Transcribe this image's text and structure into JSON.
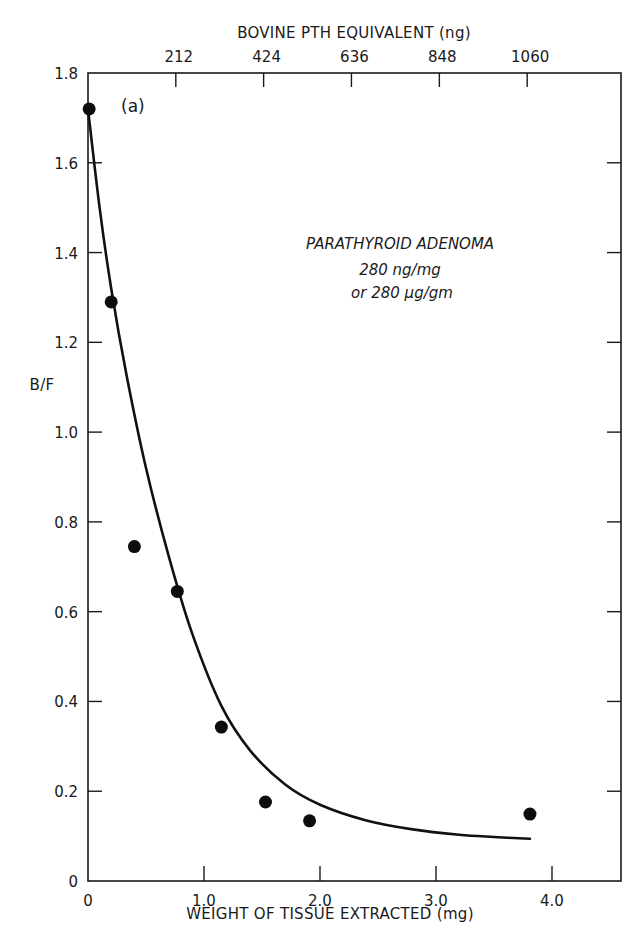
{
  "chart_data": {
    "type": "scatter",
    "title": "",
    "panel_label": "(a)",
    "xlabel": "WEIGHT OF TISSUE EXTRACTED (mg)",
    "ylabel": "B/F",
    "x2label": "BOVINE PTH EQUIVALENT  (ng)",
    "xlim": [
      0,
      4.6
    ],
    "ylim": [
      0,
      1.8
    ],
    "x_ticks": [
      0,
      1.0,
      2.0,
      3.0,
      4.0
    ],
    "x_tick_labels": [
      "0",
      "1.0",
      "2.0",
      "3.0",
      "4.0"
    ],
    "y_ticks": [
      0,
      0.2,
      0.4,
      0.6,
      0.8,
      1.0,
      1.2,
      1.4,
      1.6,
      1.8
    ],
    "y_tick_labels": [
      "0",
      "0.2",
      "0.4",
      "0.6",
      "0.8",
      "1.0",
      "1.2",
      "1.4",
      "1.6",
      "1.8"
    ],
    "x2_ticks_mg": [
      0.757,
      1.514,
      2.271,
      3.029,
      3.786
    ],
    "x2_tick_labels": [
      "212",
      "424",
      "636",
      "848",
      "1060"
    ],
    "grid": false,
    "legend": null,
    "annotations": [
      "PARATHYROID ADENOMA",
      "280 ng/mg",
      "or 280 µg/gm"
    ],
    "series": [
      {
        "name": "measured",
        "style": "filled-circle",
        "x": [
          0.01,
          0.2,
          0.4,
          0.77,
          1.15,
          1.53,
          1.91,
          3.81
        ],
        "y": [
          1.72,
          1.29,
          0.745,
          0.645,
          0.343,
          0.176,
          0.134,
          0.149
        ]
      },
      {
        "name": "fitted-curve",
        "style": "line",
        "x": [
          0.0,
          0.1,
          0.2,
          0.33,
          0.5,
          0.7,
          0.9,
          1.15,
          1.4,
          1.7,
          2.0,
          2.4,
          2.8,
          3.2,
          3.5,
          3.81
        ],
        "y": [
          1.72,
          1.5,
          1.32,
          1.13,
          0.92,
          0.72,
          0.55,
          0.39,
          0.29,
          0.215,
          0.17,
          0.135,
          0.115,
          0.103,
          0.098,
          0.094
        ]
      }
    ]
  }
}
